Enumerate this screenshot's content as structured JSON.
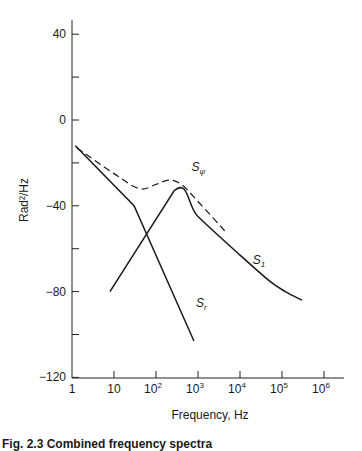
{
  "chart_data": {
    "type": "line",
    "title": "",
    "xlabel": "Frequency, Hz",
    "ylabel": "Rad²/Hz",
    "xscale": "log",
    "xlim": [
      1,
      1000000
    ],
    "ylim": [
      -120,
      45
    ],
    "grid": false,
    "legend": "none (inline curve labels)",
    "x_ticks": [
      {
        "value": 1,
        "label": "1"
      },
      {
        "value": 10,
        "label": "10"
      },
      {
        "value": 100,
        "label": "10",
        "exp": "2"
      },
      {
        "value": 1000,
        "label": "10",
        "exp": "3"
      },
      {
        "value": 10000,
        "label": "10",
        "exp": "4"
      },
      {
        "value": 100000,
        "label": "10",
        "exp": "5"
      },
      {
        "value": 1000000,
        "label": "10",
        "exp": "6"
      }
    ],
    "y_ticks": [
      {
        "value": 40,
        "label": "40"
      },
      {
        "value": 20,
        "label": ""
      },
      {
        "value": 0,
        "label": "0"
      },
      {
        "value": -20,
        "label": ""
      },
      {
        "value": -40,
        "label": "−40"
      },
      {
        "value": -60,
        "label": ""
      },
      {
        "value": -80,
        "label": "−80"
      },
      {
        "value": -100,
        "label": ""
      },
      {
        "value": -120,
        "label": "−120"
      }
    ],
    "series": [
      {
        "name": "S_r",
        "label": "S",
        "label_sub": "r",
        "style": "solid",
        "points": [
          [
            1.2,
            -12
          ],
          [
            30,
            -40
          ],
          [
            800,
            -103
          ]
        ],
        "label_at": [
          900,
          -87
        ]
      },
      {
        "name": "S_1",
        "label": "S",
        "label_sub": "1",
        "style": "solid",
        "points": [
          [
            8,
            -80
          ],
          [
            270,
            -33
          ],
          [
            1000,
            -45
          ],
          [
            10000,
            -63
          ],
          [
            50000,
            -75
          ],
          [
            120000,
            -80
          ],
          [
            300000,
            -84
          ]
        ],
        "label_at": [
          20000,
          -67
        ]
      },
      {
        "name": "S_psi",
        "label": "S",
        "label_sub": "ψ",
        "style": "dashed",
        "points": [
          [
            1.3,
            -13
          ],
          [
            10,
            -25
          ],
          [
            40,
            -32
          ],
          [
            100,
            -30
          ],
          [
            200,
            -28
          ],
          [
            400,
            -30
          ],
          [
            1000,
            -38
          ],
          [
            5000,
            -53
          ]
        ],
        "label_at": [
          700,
          -24
        ]
      }
    ]
  },
  "caption": "Fig. 2.3   Combined frequency spectra"
}
